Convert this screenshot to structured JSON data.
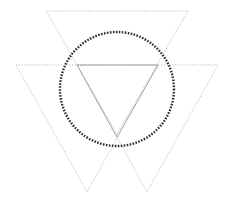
{
  "diagram": {
    "width": 231,
    "height": 202,
    "background": "#ffffff",
    "shapes": [
      {
        "id": "top-triangle",
        "type": "triangle",
        "style": "dotted",
        "stroke": "#bdbdbd",
        "points": [
          [
            46,
            11
          ],
          [
            188,
            11
          ],
          [
            117,
            134
          ]
        ]
      },
      {
        "id": "left-triangle",
        "type": "triangle",
        "style": "dotted",
        "stroke": "#bdbdbd",
        "points": [
          [
            16,
            65
          ],
          [
            158,
            65
          ],
          [
            87,
            192
          ]
        ]
      },
      {
        "id": "right-triangle",
        "type": "triangle",
        "style": "dotted",
        "stroke": "#bdbdbd",
        "points": [
          [
            77,
            65
          ],
          [
            218,
            65
          ],
          [
            147,
            192
          ]
        ]
      },
      {
        "id": "inner-triangle",
        "type": "triangle",
        "style": "solid",
        "stroke": "#a8a8a8",
        "points": [
          [
            77,
            65
          ],
          [
            158,
            65
          ],
          [
            117,
            137
          ]
        ]
      },
      {
        "id": "circle",
        "type": "circle",
        "style": "dotted",
        "stroke": "#2e2e2e",
        "center": [
          117,
          89
        ],
        "radius": 57
      }
    ]
  }
}
